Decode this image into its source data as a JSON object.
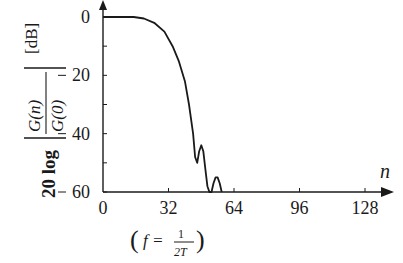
{
  "chart_data": {
    "type": "line",
    "title": "",
    "xlabel": "n",
    "ylabel": "20 log |G(n)/G(0)|",
    "ylabel_unit": "[dB]",
    "xlim": [
      0,
      132
    ],
    "ylim": [
      -60,
      0
    ],
    "grid": false,
    "legend": null,
    "x_ticks": [
      0,
      32,
      64,
      96,
      128
    ],
    "x_tick_labels": [
      "0",
      "32",
      "64",
      "96",
      "128"
    ],
    "y_ticks": [
      0,
      -20,
      -40,
      -60
    ],
    "y_tick_labels": [
      "0",
      "−20",
      "−40",
      "−60"
    ],
    "y_minor_ticks": [
      -10,
      -30,
      -50
    ],
    "annotation": {
      "text": "(f = 1/2T)",
      "at_x": 32
    },
    "series": [
      {
        "name": "normalized gain",
        "x": [
          0,
          10,
          15,
          20,
          25,
          30,
          34,
          37,
          40,
          42,
          44,
          45,
          46,
          47,
          48,
          49,
          50,
          51,
          52,
          53,
          54,
          55,
          56,
          57,
          58
        ],
        "y": [
          0,
          0,
          0,
          -0.5,
          -2,
          -5,
          -10,
          -15,
          -22,
          -30,
          -40,
          -48,
          -50,
          -46,
          -44,
          -46,
          -52,
          -58,
          -60,
          -60,
          -57,
          -55,
          -55,
          -57,
          -60
        ]
      }
    ]
  },
  "labels": {
    "y_unit": "[dB]",
    "y_prefix": "20 log",
    "y_num": "G(n)",
    "y_den": "G(0)",
    "x_axis": "n",
    "annot_f": "f =",
    "annot_num": "1",
    "annot_den": "2T"
  }
}
